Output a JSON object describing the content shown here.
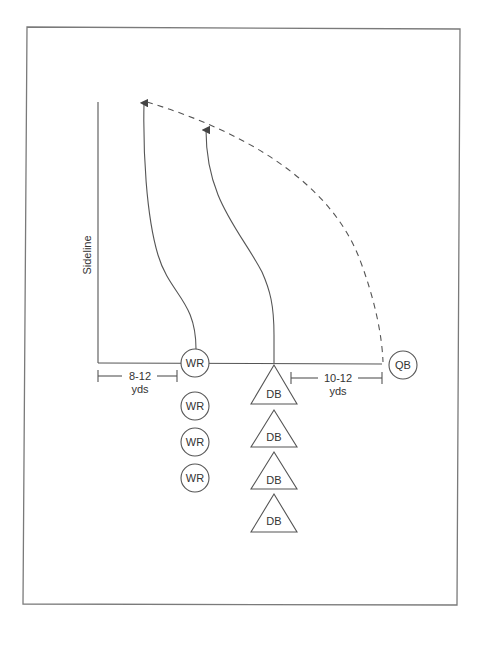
{
  "diagram": {
    "sideline_label": "Sideline",
    "distances": [
      {
        "id": "wr-distance",
        "line1": "8-12",
        "line2": "yds"
      },
      {
        "id": "qb-distance",
        "line1": "10-12",
        "line2": "yds"
      }
    ],
    "qb": {
      "label": "QB"
    },
    "receivers": [
      {
        "label": "WR",
        "role": "active"
      },
      {
        "label": "WR",
        "role": "waiting"
      },
      {
        "label": "WR",
        "role": "waiting"
      },
      {
        "label": "WR",
        "role": "waiting"
      }
    ],
    "defenders": [
      {
        "label": "DB",
        "role": "active"
      },
      {
        "label": "DB",
        "role": "waiting"
      },
      {
        "label": "DB",
        "role": "waiting"
      },
      {
        "label": "DB",
        "role": "waiting"
      }
    ],
    "routes": [
      {
        "name": "wr-route",
        "style": "solid",
        "arrow": true
      },
      {
        "name": "db-route",
        "style": "solid",
        "arrow": true
      },
      {
        "name": "pass-trajectory",
        "style": "dashed",
        "arrow": false
      }
    ],
    "colors": {
      "line": "#555555",
      "frame": "#7a7a7a",
      "text": "#333333",
      "background": "#ffffff"
    }
  }
}
